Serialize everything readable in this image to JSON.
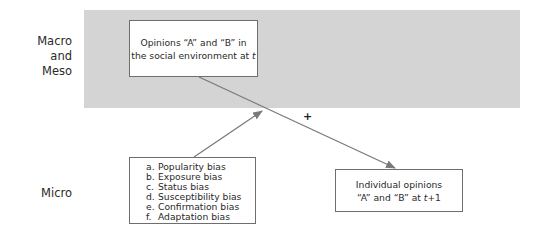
{
  "levels": {
    "macro_meso_line1": "Macro and",
    "macro_meso_line2": "Meso",
    "micro": "Micro"
  },
  "boxes": {
    "social_environment": {
      "line1": "Opinions “A” and “B” in",
      "line2_prefix": "the social environment at ",
      "line2_var": "t"
    },
    "biases": {
      "items": [
        {
          "letter": "a.",
          "label": "Popularity bias"
        },
        {
          "letter": "b.",
          "label": "Exposure bias"
        },
        {
          "letter": "c.",
          "label": "Status bias"
        },
        {
          "letter": "d.",
          "label": "Susceptibility bias"
        },
        {
          "letter": "e.",
          "label": "Confirmation bias"
        },
        {
          "letter": "f.",
          "label": "Adaptation bias"
        }
      ]
    },
    "individual_opinions": {
      "line1": "Individual opinions",
      "line2_prefix": "“A” and “B” at ",
      "line2_var": "t",
      "line2_suffix": "+1"
    }
  },
  "edges": {
    "main_sign": "+"
  },
  "colors": {
    "band": "#d4d4d4",
    "arrow": "#7a7a7a",
    "border": "#6e6e6e"
  }
}
